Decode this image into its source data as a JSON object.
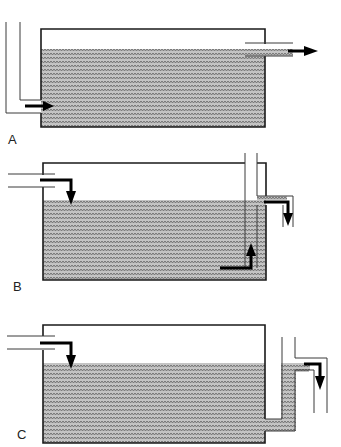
{
  "figure": {
    "panels": [
      {
        "id": "A",
        "label": "A",
        "inlet": "bottom-left side inlet through L-shaped pipe",
        "outlet": "surface overflow pipe on right at water level"
      },
      {
        "id": "B",
        "label": "B",
        "inlet": "top-left inlet pouring down onto surface",
        "outlet": "internal standpipe drawing from bottom, exiting at right"
      },
      {
        "id": "C",
        "label": "C",
        "inlet": "top-left inlet pouring down onto surface",
        "outlet": "bottom outlet into external U-shaped riser overflowing on right"
      }
    ]
  },
  "colors": {
    "line": "#1a1a1a",
    "water_base": "#bdbdbd",
    "water_pattern": "#6e6e6e",
    "arrow": "#000000",
    "background": "#ffffff"
  }
}
